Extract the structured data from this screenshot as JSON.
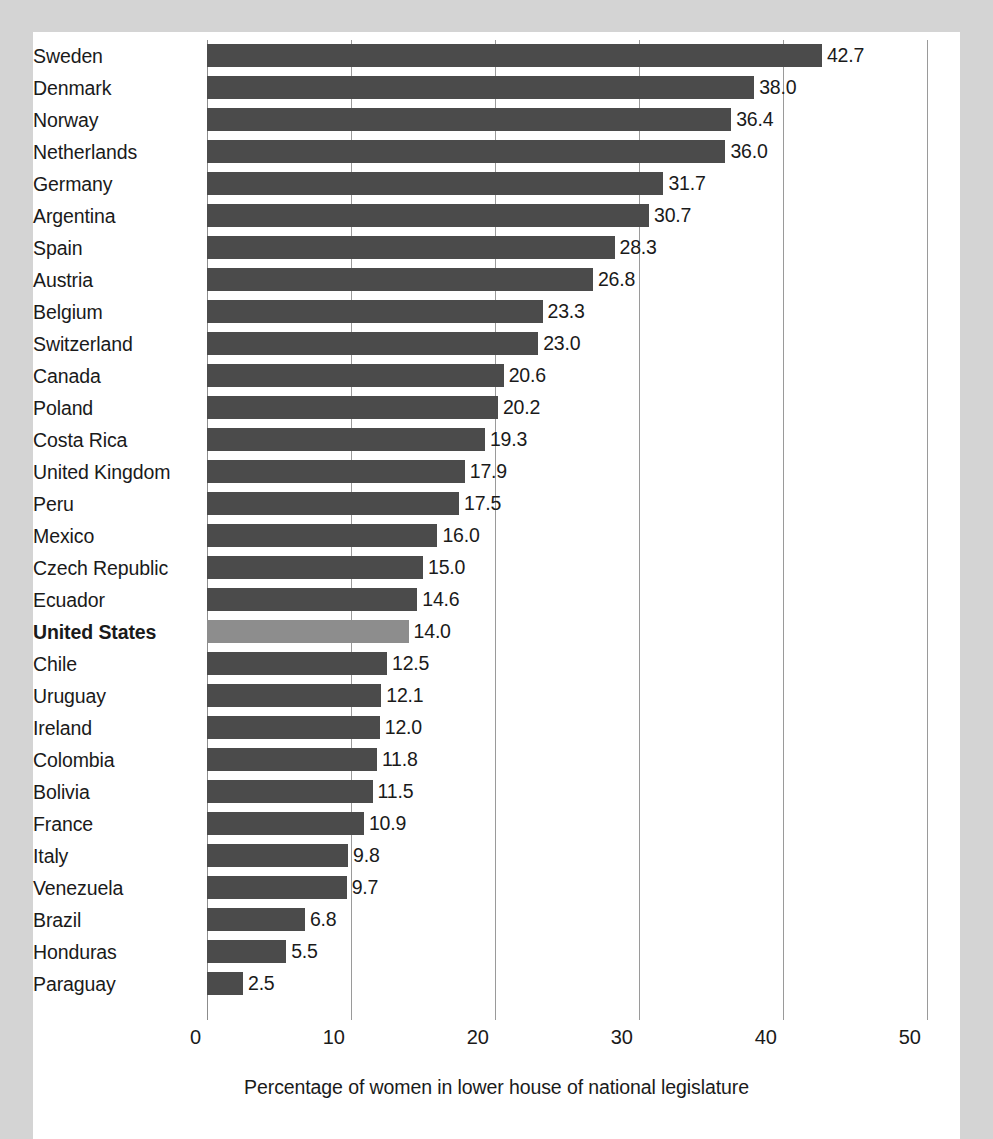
{
  "chart_data": {
    "type": "bar",
    "orientation": "horizontal",
    "title": "",
    "subtitle": "",
    "xlabel": "Percentage of women in lower house of national legislature",
    "ylabel": "",
    "xlim": [
      0,
      50
    ],
    "xticks": [
      0,
      10,
      20,
      30,
      40,
      50
    ],
    "xtick_labels": [
      "0",
      "10",
      "20",
      "30",
      "40",
      "50"
    ],
    "grid": true,
    "legend": "none",
    "value_label_format": "one decimal",
    "highlight_category": "United States",
    "categories": [
      "Sweden",
      "Denmark",
      "Norway",
      "Netherlands",
      "Germany",
      "Argentina",
      "Spain",
      "Austria",
      "Belgium",
      "Switzerland",
      "Canada",
      "Poland",
      "Costa Rica",
      "United Kingdom",
      "Peru",
      "Mexico",
      "Czech Republic",
      "Ecuador",
      "United States",
      "Chile",
      "Uruguay",
      "Ireland",
      "Colombia",
      "Bolivia",
      "France",
      "Italy",
      "Venezuela",
      "Brazil",
      "Honduras",
      "Paraguay"
    ],
    "values": [
      42.7,
      38.0,
      36.4,
      36.0,
      31.7,
      30.7,
      28.3,
      26.8,
      23.3,
      23.0,
      20.6,
      20.2,
      19.3,
      17.9,
      17.5,
      16.0,
      15.0,
      14.6,
      14.0,
      12.5,
      12.1,
      12.0,
      11.8,
      11.5,
      10.9,
      9.8,
      9.7,
      6.8,
      5.5,
      2.5
    ],
    "value_labels": [
      "42.7",
      "38.0",
      "36.4",
      "36.0",
      "31.7",
      "30.7",
      "28.3",
      "26.8",
      "23.3",
      "23.0",
      "20.6",
      "20.2",
      "19.3",
      "17.9",
      "17.5",
      "16.0",
      "15.0",
      "14.6",
      "14.0",
      "12.5",
      "12.1",
      "12.0",
      "11.8",
      "11.5",
      "10.9",
      "9.8",
      "9.7",
      "6.8",
      "5.5",
      "2.5"
    ],
    "colors": {
      "bar": "#4b4b4b",
      "bar_highlight": "#8d8d8d",
      "gridline": "#9a9a9a",
      "text": "#1a1a1a",
      "panel_background": "#ffffff",
      "page_background": "#d4d4d4"
    }
  }
}
